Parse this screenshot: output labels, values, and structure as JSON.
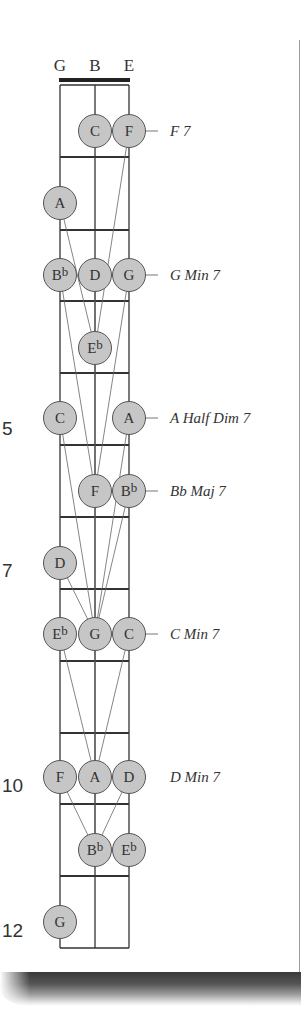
{
  "diagram": {
    "strings": [
      {
        "label": "G",
        "x": 60
      },
      {
        "label": "B",
        "x": 95
      },
      {
        "label": "E",
        "x": 129
      }
    ],
    "nut_y": 80,
    "fret_lines_y": [
      85,
      157,
      230,
      301,
      373,
      445,
      517,
      589,
      661,
      733,
      804,
      876,
      948
    ],
    "fret_numbers": [
      {
        "label": "5",
        "y": 438
      },
      {
        "label": "7",
        "y": 580
      },
      {
        "label": "10",
        "y": 795
      },
      {
        "label": "12",
        "y": 940
      }
    ],
    "chords": [
      {
        "label": "F 7",
        "y": 131,
        "leader_from_x": 129
      },
      {
        "label": "G Min 7",
        "y": 275,
        "leader_from_x": 129
      },
      {
        "label": "A Half Dim 7",
        "y": 418,
        "leader_from_x": 129
      },
      {
        "label": "Bb Maj 7",
        "y": 491,
        "leader_from_x": 129
      },
      {
        "label": "C Min 7",
        "y": 634,
        "leader_from_x": 129
      },
      {
        "label": "D Min 7",
        "y": 777,
        "leader_from_x": null
      }
    ],
    "notes": [
      {
        "name": "C",
        "accidental": "",
        "x": 95,
        "y": 131
      },
      {
        "name": "F",
        "accidental": "",
        "x": 129,
        "y": 131
      },
      {
        "name": "A",
        "accidental": "",
        "x": 60,
        "y": 203
      },
      {
        "name": "B",
        "accidental": "b",
        "x": 60,
        "y": 275
      },
      {
        "name": "D",
        "accidental": "",
        "x": 95,
        "y": 275
      },
      {
        "name": "G",
        "accidental": "",
        "x": 129,
        "y": 275
      },
      {
        "name": "E",
        "accidental": "b",
        "x": 95,
        "y": 348
      },
      {
        "name": "C",
        "accidental": "",
        "x": 60,
        "y": 418
      },
      {
        "name": "A",
        "accidental": "",
        "x": 129,
        "y": 418
      },
      {
        "name": "F",
        "accidental": "",
        "x": 95,
        "y": 491
      },
      {
        "name": "B",
        "accidental": "b",
        "x": 129,
        "y": 491
      },
      {
        "name": "D",
        "accidental": "",
        "x": 60,
        "y": 563
      },
      {
        "name": "E",
        "accidental": "b",
        "x": 60,
        "y": 634
      },
      {
        "name": "G",
        "accidental": "",
        "x": 95,
        "y": 634
      },
      {
        "name": "C",
        "accidental": "",
        "x": 129,
        "y": 634
      },
      {
        "name": "F",
        "accidental": "",
        "x": 60,
        "y": 777
      },
      {
        "name": "A",
        "accidental": "",
        "x": 95,
        "y": 777
      },
      {
        "name": "D",
        "accidental": "",
        "x": 129,
        "y": 777
      },
      {
        "name": "B",
        "accidental": "b",
        "x": 95,
        "y": 850
      },
      {
        "name": "E",
        "accidental": "b",
        "x": 129,
        "y": 850
      },
      {
        "name": "G",
        "accidental": "",
        "x": 60,
        "y": 922
      }
    ],
    "voice_lines": [
      [
        129,
        131,
        95,
        348
      ],
      [
        60,
        203,
        95,
        348
      ],
      [
        95,
        275,
        95,
        348
      ],
      [
        60,
        275,
        95,
        491
      ],
      [
        129,
        275,
        95,
        491
      ],
      [
        95,
        348,
        95,
        491
      ],
      [
        60,
        418,
        95,
        634
      ],
      [
        129,
        418,
        95,
        634
      ],
      [
        129,
        491,
        95,
        634
      ],
      [
        60,
        563,
        95,
        634
      ],
      [
        95,
        491,
        95,
        634
      ],
      [
        60,
        634,
        95,
        777
      ],
      [
        129,
        634,
        95,
        777
      ],
      [
        95,
        634,
        95,
        777
      ],
      [
        60,
        777,
        95,
        850
      ],
      [
        95,
        777,
        95,
        850
      ],
      [
        129,
        777,
        95,
        850
      ]
    ],
    "colors": {
      "dot_fill": "#c6c6c6",
      "dot_stroke": "#555555",
      "line": "#333333",
      "voice_line": "#666666"
    }
  }
}
